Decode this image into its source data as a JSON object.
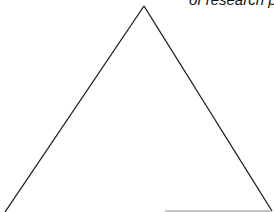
{
  "caption": {
    "text": "of research p"
  },
  "diagram": {
    "shape": "triangle",
    "stroke_color": "#1a1a1a",
    "base_color": "#8a8a8a",
    "apex": [
      144,
      6
    ],
    "left_base": [
      5,
      212
    ],
    "right_base": [
      272,
      211
    ],
    "base_segment": [
      [
        165,
        211
      ],
      [
        272,
        211
      ]
    ]
  }
}
